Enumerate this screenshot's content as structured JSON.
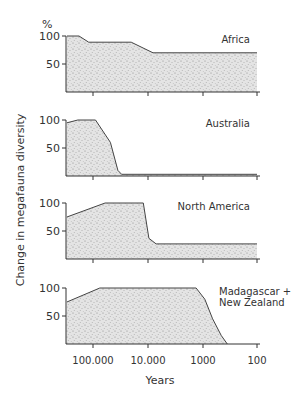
{
  "chart_data": {
    "type": "area",
    "title": "",
    "xlabel": "Years",
    "ylabel": "Change in megafauna diversity",
    "y_unit": "%",
    "x_scale": "log (years before present, decreasing to the right)",
    "x_ticks": [
      100000,
      10000,
      1000,
      100
    ],
    "x_tick_labels": [
      "100.000",
      "10.000",
      "1000",
      "100"
    ],
    "y_ticks": [
      50,
      100
    ],
    "y_tick_labels": [
      "50",
      "100"
    ],
    "ylim": [
      0,
      100
    ],
    "xlim": [
      300000,
      100
    ],
    "grid": false,
    "panels": [
      {
        "name": "Africa",
        "label_lines": [
          "Africa"
        ],
        "x": [
          300000,
          180000,
          120000,
          20000,
          8000,
          100
        ],
        "values": [
          100,
          100,
          89,
          89,
          70,
          70
        ]
      },
      {
        "name": "Australia",
        "label_lines": [
          "Australia"
        ],
        "x": [
          300000,
          190000,
          90000,
          48000,
          35000,
          30000,
          100
        ],
        "values": [
          95,
          100,
          100,
          60,
          10,
          3,
          3
        ]
      },
      {
        "name": "North America",
        "label_lines": [
          "North America"
        ],
        "x": [
          300000,
          60000,
          12000,
          9500,
          7000,
          100
        ],
        "values": [
          75,
          100,
          100,
          37,
          27,
          27
        ]
      },
      {
        "name": "Madagascar + New Zealand",
        "label_lines": [
          "Madagascar +",
          "New Zealand"
        ],
        "x": [
          300000,
          75000,
          1300,
          900,
          650,
          450,
          350
        ],
        "values": [
          75,
          100,
          100,
          80,
          45,
          15,
          0
        ]
      }
    ]
  },
  "labels": {
    "y_unit": "%",
    "ylabel": "Change in megafauna diversity",
    "xlabel": "Years",
    "panel_names": [
      "Africa",
      "Australia",
      "North America",
      "Madagascar +",
      "New Zealand"
    ],
    "x_tick_labels": [
      "100.000",
      "10.000",
      "1000",
      "100"
    ],
    "y100": "100",
    "y50": "50"
  }
}
